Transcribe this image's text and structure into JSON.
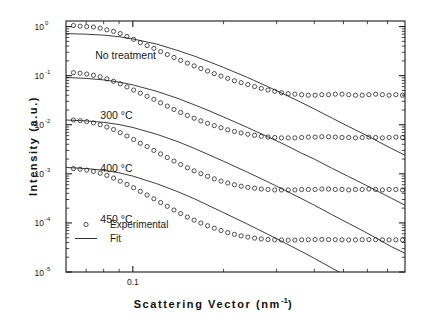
{
  "figure": {
    "kind": "scientific-plot",
    "background": "#ffffff",
    "ink": "#1a1a1a"
  },
  "axes": {
    "x_title_text": "Scattering Vector (nm",
    "x_title_sup": "-1",
    "x_title_tail": ")",
    "x_title_full": "Scattering Vector (nm-1)",
    "y_title": "Intensity (a.u.)",
    "x_tick_labels": [
      "0.1"
    ],
    "y_tick_labels": [
      "10",
      "10",
      "10",
      "10",
      "10",
      "10"
    ],
    "y_tick_exponents": [
      "0",
      "-1",
      "-2",
      "-3",
      "-4",
      "-5"
    ]
  },
  "legend": {
    "experimental_label": "Experimental",
    "fit_label": "Fit",
    "marker": "open-circle",
    "line": "solid"
  },
  "annotations": {
    "labels": [
      "No treatment",
      "300 °C",
      "400 °C",
      "450 °C"
    ]
  },
  "chart_data": {
    "type": "scatter",
    "title": "",
    "xlabel": "Scattering Vector (nm^-1)",
    "ylabel": "Intensity (a.u.)",
    "xscale": "log",
    "yscale": "log",
    "xlim": [
      0.06,
      0.8
    ],
    "ylim": [
      1e-05,
      1.3
    ],
    "grid": false,
    "legend_position": "lower-left-inside",
    "legend_entries": [
      "Experimental",
      "Fit"
    ],
    "annotations": [
      {
        "text": "No treatment",
        "x": 0.075,
        "y": 0.22
      },
      {
        "text": "300 °C",
        "x": 0.078,
        "y": 0.013
      },
      {
        "text": "400 °C",
        "x": 0.078,
        "y": 0.0011
      },
      {
        "text": "450 °C",
        "x": 0.078,
        "y": 0.0001
      }
    ],
    "series": [
      {
        "name": "No treatment",
        "kind": "experimental-points",
        "marker": "open-circle",
        "x": [
          0.0635,
          0.0668,
          0.0703,
          0.074,
          0.0779,
          0.082,
          0.0863,
          0.0908,
          0.0956,
          0.1006,
          0.1059,
          0.1115,
          0.1174,
          0.1236,
          0.1301,
          0.1369,
          0.1441,
          0.1517,
          0.1597,
          0.1681,
          0.177,
          0.1863,
          0.1961,
          0.2064,
          0.2173,
          0.2287,
          0.2408,
          0.2535,
          0.2668,
          0.2809,
          0.2957,
          0.3113,
          0.3277,
          0.345,
          0.3632,
          0.3823,
          0.4025,
          0.4237,
          0.4461,
          0.4696,
          0.4943,
          0.5204,
          0.5479,
          0.5768,
          0.6072,
          0.6392,
          0.673,
          0.7085,
          0.7459,
          0.7853
        ],
        "y": [
          1.05,
          1.02,
          1.0,
          0.98,
          0.93,
          0.86,
          0.8,
          0.72,
          0.63,
          0.55,
          0.47,
          0.41,
          0.36,
          0.31,
          0.27,
          0.235,
          0.205,
          0.18,
          0.158,
          0.14,
          0.124,
          0.11,
          0.098,
          0.088,
          0.079,
          0.072,
          0.066,
          0.06,
          0.055,
          0.051,
          0.048,
          0.045,
          0.043,
          0.042,
          0.041,
          0.04,
          0.04,
          0.041,
          0.041,
          0.042,
          0.042,
          0.041,
          0.04,
          0.04,
          0.041,
          0.042,
          0.041,
          0.04,
          0.041,
          0.04
        ]
      },
      {
        "name": "No treatment",
        "kind": "fit-line",
        "x": [
          0.06,
          0.07,
          0.08,
          0.09,
          0.1,
          0.12,
          0.14,
          0.16,
          0.18,
          0.2,
          0.24,
          0.28,
          0.32,
          0.36,
          0.4,
          0.46,
          0.52,
          0.58,
          0.65,
          0.72,
          0.8
        ],
        "y": [
          0.72,
          0.7,
          0.67,
          0.62,
          0.56,
          0.44,
          0.33,
          0.25,
          0.19,
          0.147,
          0.092,
          0.06,
          0.041,
          0.029,
          0.021,
          0.0135,
          0.0092,
          0.0066,
          0.0046,
          0.0033,
          0.0024
        ]
      },
      {
        "name": "300 °C",
        "kind": "experimental-points",
        "marker": "open-circle",
        "x": [
          0.0635,
          0.0668,
          0.0703,
          0.074,
          0.0779,
          0.082,
          0.0863,
          0.0908,
          0.0956,
          0.1006,
          0.1059,
          0.1115,
          0.1174,
          0.1236,
          0.1301,
          0.1369,
          0.1441,
          0.1517,
          0.1597,
          0.1681,
          0.177,
          0.1863,
          0.1961,
          0.2064,
          0.2173,
          0.2287,
          0.2408,
          0.2535,
          0.2668,
          0.2809,
          0.2957,
          0.3113,
          0.3277,
          0.345,
          0.3632,
          0.3823,
          0.4025,
          0.4237,
          0.4461,
          0.4696,
          0.4943,
          0.5204,
          0.5479,
          0.5768,
          0.6072,
          0.6392,
          0.673,
          0.7085,
          0.7459,
          0.7853
        ],
        "y": [
          0.115,
          0.112,
          0.108,
          0.102,
          0.095,
          0.086,
          0.077,
          0.068,
          0.059,
          0.051,
          0.044,
          0.038,
          0.033,
          0.028,
          0.024,
          0.0205,
          0.0178,
          0.0155,
          0.0136,
          0.012,
          0.0107,
          0.0096,
          0.0087,
          0.0079,
          0.0073,
          0.0068,
          0.0064,
          0.0061,
          0.0058,
          0.0056,
          0.0055,
          0.0054,
          0.0054,
          0.0054,
          0.0055,
          0.0056,
          0.0056,
          0.0057,
          0.0057,
          0.0056,
          0.0055,
          0.0055,
          0.0054,
          0.0055,
          0.0056,
          0.0055,
          0.0054,
          0.0055,
          0.0056,
          0.0055
        ]
      },
      {
        "name": "300 °C",
        "kind": "fit-line",
        "x": [
          0.06,
          0.07,
          0.08,
          0.09,
          0.1,
          0.12,
          0.14,
          0.16,
          0.18,
          0.2,
          0.24,
          0.28,
          0.32,
          0.36,
          0.4,
          0.46,
          0.52,
          0.58,
          0.65,
          0.72,
          0.8
        ],
        "y": [
          0.092,
          0.088,
          0.082,
          0.074,
          0.065,
          0.048,
          0.035,
          0.0255,
          0.019,
          0.0144,
          0.0088,
          0.0057,
          0.0039,
          0.0027,
          0.002,
          0.00128,
          0.00088,
          0.00063,
          0.00044,
          0.00032,
          0.00023
        ]
      },
      {
        "name": "400 °C",
        "kind": "experimental-points",
        "marker": "open-circle",
        "x": [
          0.0635,
          0.0668,
          0.0703,
          0.074,
          0.0779,
          0.082,
          0.0863,
          0.0908,
          0.0956,
          0.1006,
          0.1059,
          0.1115,
          0.1174,
          0.1236,
          0.1301,
          0.1369,
          0.1441,
          0.1517,
          0.1597,
          0.1681,
          0.177,
          0.1863,
          0.1961,
          0.2064,
          0.2173,
          0.2287,
          0.2408,
          0.2535,
          0.2668,
          0.2809,
          0.2957,
          0.3113,
          0.3277,
          0.345,
          0.3632,
          0.3823,
          0.4025,
          0.4237,
          0.4461,
          0.4696,
          0.4943,
          0.5204,
          0.5479,
          0.5768,
          0.6072,
          0.6392,
          0.673,
          0.7085,
          0.7459,
          0.7853
        ],
        "y": [
          0.0125,
          0.0121,
          0.0116,
          0.0109,
          0.01,
          0.009,
          0.008,
          0.0069,
          0.0059,
          0.005,
          0.0042,
          0.0036,
          0.003,
          0.00255,
          0.00215,
          0.00182,
          0.00155,
          0.00133,
          0.00115,
          0.00101,
          0.00089,
          0.00079,
          0.00071,
          0.00065,
          0.0006,
          0.00056,
          0.00053,
          0.00051,
          0.00049,
          0.00048,
          0.00047,
          0.00047,
          0.00047,
          0.00047,
          0.00048,
          0.00048,
          0.00048,
          0.00049,
          0.00049,
          0.00048,
          0.00048,
          0.00047,
          0.00048,
          0.00048,
          0.00049,
          0.00048,
          0.00047,
          0.00048,
          0.00048,
          0.00047
        ]
      },
      {
        "name": "400 °C",
        "kind": "fit-line",
        "x": [
          0.06,
          0.07,
          0.08,
          0.09,
          0.1,
          0.12,
          0.14,
          0.16,
          0.18,
          0.2,
          0.24,
          0.28,
          0.32,
          0.36,
          0.4,
          0.46,
          0.52,
          0.58,
          0.65,
          0.72,
          0.8
        ],
        "y": [
          0.0125,
          0.012,
          0.0112,
          0.0101,
          0.0088,
          0.0064,
          0.0046,
          0.0033,
          0.0024,
          0.0018,
          0.00108,
          0.00069,
          0.00046,
          0.00032,
          0.00023,
          0.000145,
          9.8e-05,
          6.9e-05,
          4.7e-05,
          3.3e-05,
          2.4e-05
        ]
      },
      {
        "name": "450 °C",
        "kind": "experimental-points",
        "marker": "open-circle",
        "x": [
          0.0635,
          0.0668,
          0.0703,
          0.074,
          0.0779,
          0.082,
          0.0863,
          0.0908,
          0.0956,
          0.1006,
          0.1059,
          0.1115,
          0.1174,
          0.1236,
          0.1301,
          0.1369,
          0.1441,
          0.1517,
          0.1597,
          0.1681,
          0.177,
          0.1863,
          0.1961,
          0.2064,
          0.2173,
          0.2287,
          0.2408,
          0.2535,
          0.2668,
          0.2809,
          0.2957,
          0.3113,
          0.3277,
          0.345,
          0.3632,
          0.3823,
          0.4025,
          0.4237,
          0.4461,
          0.4696,
          0.4943,
          0.5204,
          0.5479,
          0.5768,
          0.6072,
          0.6392,
          0.673,
          0.7085,
          0.7459,
          0.7853
        ],
        "y": [
          0.00128,
          0.00124,
          0.00119,
          0.00112,
          0.00103,
          0.00093,
          0.00082,
          0.00071,
          0.00061,
          0.00052,
          0.00044,
          0.00037,
          0.00031,
          0.00026,
          0.000218,
          0.000183,
          0.000155,
          0.000132,
          0.000114,
          9.95e-05,
          8.75e-05,
          7.8e-05,
          7e-05,
          6.35e-05,
          5.85e-05,
          5.45e-05,
          5.15e-05,
          4.9e-05,
          4.72e-05,
          4.6e-05,
          4.52e-05,
          4.48e-05,
          4.46e-05,
          4.48e-05,
          4.52e-05,
          4.55e-05,
          4.58e-05,
          4.6e-05,
          4.58e-05,
          4.55e-05,
          4.52e-05,
          4.5e-05,
          4.52e-05,
          4.55e-05,
          4.58e-05,
          4.55e-05,
          4.52e-05,
          4.5e-05,
          4.52e-05,
          4.5e-05
        ]
      },
      {
        "name": "450 °C",
        "kind": "fit-line",
        "x": [
          0.06,
          0.07,
          0.08,
          0.09,
          0.1,
          0.12,
          0.14,
          0.16,
          0.18,
          0.2,
          0.24,
          0.28,
          0.32,
          0.36,
          0.4,
          0.46,
          0.52,
          0.58,
          0.65,
          0.72,
          0.8
        ],
        "y": [
          0.00135,
          0.00128,
          0.00118,
          0.00105,
          0.0009,
          0.00063,
          0.00044,
          0.00031,
          0.00022,
          0.000162,
          9.45e-05,
          5.9e-05,
          3.9e-05,
          2.68e-05,
          1.9e-05,
          1.18e-05,
          7.9e-06,
          5.5e-06,
          3.7e-06,
          2.6e-06,
          1.8e-06
        ]
      }
    ]
  }
}
